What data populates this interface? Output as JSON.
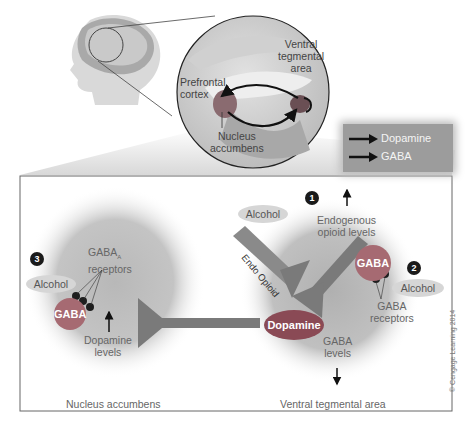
{
  "inset": {
    "labels": {
      "vta": [
        "Ventral",
        "tegmental",
        "area"
      ],
      "prefrontal": [
        "Prefrontal",
        "cortex"
      ],
      "nucleus": [
        "Nucleus",
        "accumbens"
      ]
    }
  },
  "legend": {
    "items": [
      {
        "label": "Dopamine",
        "color": "#111111"
      },
      {
        "label": "GABA",
        "color": "#111111"
      }
    ]
  },
  "panel": {
    "left_region": {
      "title": "Nucleus accumbens",
      "step": "3",
      "alcohol": "Alcohol",
      "receptors_label": "GABA",
      "receptors_subscript": "A",
      "receptors_label2": "receptors",
      "gaba": "GABA",
      "dopamine_levels": [
        "Dopamine",
        "levels"
      ],
      "dopamine_arrow": "up"
    },
    "right_region": {
      "title": "Ventral tegmental area",
      "step1": "1",
      "step2": "2",
      "alcohol1": "Alcohol",
      "alcohol2": "Alcohol",
      "endogenous": [
        "Endogenous",
        "opioid levels"
      ],
      "endo_opioid": "Endo Opioid",
      "gaba": "GABA",
      "gaba_receptors": [
        "GABA",
        "receptors"
      ],
      "gaba_levels": [
        "GABA",
        "levels"
      ],
      "dopamine": "Dopamine",
      "endogenous_arrow": "up",
      "gaba_arrow": "down"
    }
  },
  "colors": {
    "gaba_cell": "#a66a72",
    "dopamine_cell": "#8a4a55",
    "neuron_gray": "#7a7a7a",
    "region_gray": "#b5b5b5",
    "legend_bg": "#9c9c9c"
  },
  "copyright": "© Cengage Learning 2014"
}
